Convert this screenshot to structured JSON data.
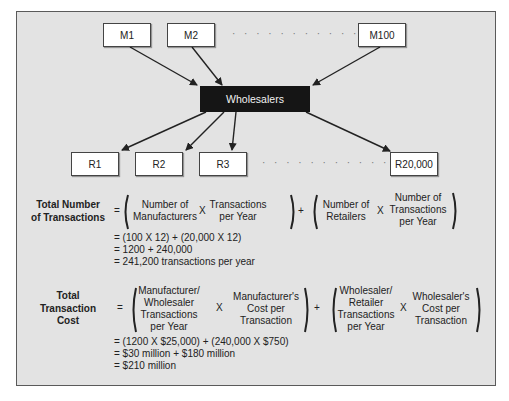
{
  "diagram": {
    "manufacturers": [
      "M1",
      "M2",
      "M100"
    ],
    "hub": "Wholesalers",
    "retailers": [
      "R1",
      "R2",
      "R3",
      "R20,000"
    ],
    "ellipsis": "· · · · · · · · · · · · ·"
  },
  "transactions": {
    "label": [
      "Total Number",
      "of Transactions"
    ],
    "eq": "=",
    "term1_a": [
      "Number of",
      "Manufacturers"
    ],
    "term1_b": [
      "Transactions",
      "per Year"
    ],
    "term2_a": [
      "Number of",
      "Retailers"
    ],
    "term2_b": [
      "Number of",
      "Transactions",
      "per Year"
    ],
    "times": "X",
    "plus": "+",
    "steps": [
      "= (100 X 12) + (20,000 X 12)",
      "= 1200 + 240,000",
      "= 241,200 transactions per year"
    ]
  },
  "cost": {
    "label": [
      "Total",
      "Transaction",
      "Cost"
    ],
    "eq": "=",
    "term1_a": [
      "Manufacturer/",
      "Wholesaler",
      "Transactions",
      "per Year"
    ],
    "term1_b": [
      "Manufacturer's",
      "Cost per",
      "Transaction"
    ],
    "term2_a": [
      "Wholesaler/",
      "Retailer",
      "Transactions",
      "per Year"
    ],
    "term2_b": [
      "Wholesaler's",
      "Cost per",
      "Transaction"
    ],
    "times": "X",
    "plus": "+",
    "steps": [
      "= (1200 X $25,000) + (240,000 X $750)",
      "= $30 million + $180 million",
      "= $210 million"
    ]
  },
  "colors": {
    "panel_bg": "#e3e3e3",
    "hub_bg": "#151515",
    "border": "#5a5a5a"
  }
}
